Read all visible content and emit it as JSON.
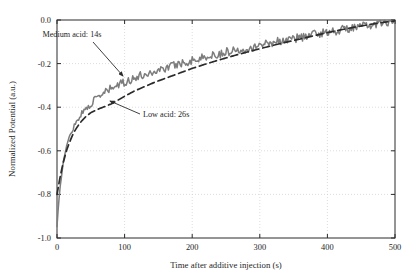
{
  "chart_data": {
    "type": "line",
    "title": "",
    "subtitle": "",
    "xlabel": "Time after additive injection (s)",
    "ylabel": "Normalized Potential (a.u.)",
    "xlim": [
      0,
      500
    ],
    "ylim": [
      -1.0,
      0.0
    ],
    "xticks": [
      0,
      100,
      200,
      300,
      400,
      500
    ],
    "yticks": [
      0.0,
      -0.2,
      -0.4,
      -0.6,
      -0.8,
      -1.0
    ],
    "xtick_labels": [
      "0",
      "100",
      "200",
      "300",
      "400",
      "500"
    ],
    "ytick_labels": [
      "0.0",
      "-0.2",
      "-0.4",
      "-0.6",
      "-0.8",
      "-1.0"
    ],
    "grid": true,
    "grid_style": "dotted",
    "grid_color": "#cfcfcf",
    "legend": "none",
    "legend_position": "inline-annotations",
    "axes_color": "#2a2a2a",
    "background": "#ffffff",
    "series": [
      {
        "name": "Medium acid: 14s",
        "style": "solid",
        "color": "#7d7d7d",
        "noisy": true,
        "time_constant_s": 14,
        "x": [
          0,
          2,
          4,
          6,
          8,
          10,
          14,
          18,
          22,
          26,
          30,
          36,
          42,
          50,
          60,
          70,
          80,
          90,
          100,
          115,
          130,
          145,
          160,
          180,
          200,
          220,
          240,
          260,
          280,
          300,
          320,
          340,
          360,
          380,
          400,
          420,
          440,
          460,
          480,
          500
        ],
        "y": [
          -0.95,
          -0.86,
          -0.79,
          -0.73,
          -0.68,
          -0.64,
          -0.58,
          -0.54,
          -0.51,
          -0.48,
          -0.46,
          -0.43,
          -0.41,
          -0.385,
          -0.355,
          -0.335,
          -0.315,
          -0.3,
          -0.285,
          -0.265,
          -0.25,
          -0.235,
          -0.22,
          -0.2,
          -0.185,
          -0.17,
          -0.155,
          -0.14,
          -0.13,
          -0.115,
          -0.1,
          -0.09,
          -0.08,
          -0.065,
          -0.055,
          -0.045,
          -0.035,
          -0.025,
          -0.015,
          -0.005
        ]
      },
      {
        "name": "Low acid: 26s",
        "style": "dashed",
        "color": "#2b2b2b",
        "noisy": false,
        "time_constant_s": 26,
        "x": [
          0,
          2,
          4,
          6,
          8,
          10,
          14,
          18,
          22,
          26,
          30,
          36,
          42,
          50,
          60,
          70,
          80,
          90,
          100,
          115,
          130,
          145,
          160,
          180,
          200,
          220,
          240,
          260,
          280,
          300,
          320,
          340,
          360,
          380,
          400,
          420,
          440,
          460,
          480,
          500
        ],
        "y": [
          -0.8,
          -0.765,
          -0.73,
          -0.7,
          -0.67,
          -0.645,
          -0.6,
          -0.565,
          -0.535,
          -0.51,
          -0.49,
          -0.465,
          -0.445,
          -0.425,
          -0.41,
          -0.398,
          -0.385,
          -0.368,
          -0.35,
          -0.325,
          -0.305,
          -0.285,
          -0.268,
          -0.245,
          -0.222,
          -0.202,
          -0.183,
          -0.165,
          -0.148,
          -0.132,
          -0.116,
          -0.101,
          -0.087,
          -0.072,
          -0.058,
          -0.045,
          -0.033,
          -0.022,
          -0.012,
          -0.004
        ]
      }
    ],
    "annotations": [
      {
        "label": "Medium acid: 14s",
        "text_x": 72,
        "text_y": 37,
        "arrow_from_x": 93,
        "arrow_from_y": 42,
        "arrow_to_x": 123,
        "arrow_to_y": 76
      },
      {
        "label": "Low acid: 26s",
        "text_x": 143,
        "text_y": 117,
        "arrow_from_x": 140,
        "arrow_from_y": 114,
        "arrow_to_x": 110,
        "arrow_to_y": 101
      }
    ]
  }
}
